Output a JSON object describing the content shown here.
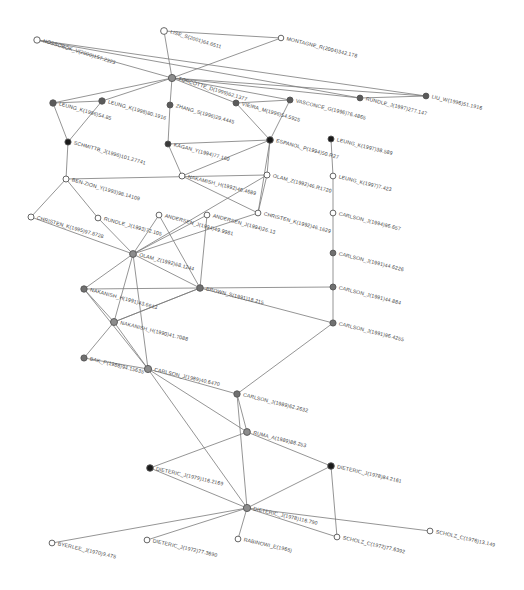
{
  "figure": {
    "type": "citation-network-graph",
    "width": 524,
    "height": 590,
    "background": "#ffffff",
    "edge_color": "#7a7a7a",
    "node_fill_dark": "#1a1a1a",
    "node_fill_mid": "#707070",
    "node_fill_light": "#ffffff",
    "node_stroke": "#555555",
    "label_color": "#4a4a4a"
  },
  "chart_data": {
    "type": "scatter",
    "title": "",
    "xlabel": "",
    "ylabel": "",
    "grid": false,
    "legend": "none",
    "nodes": [
      {
        "id": "n0",
        "label": "HOSSOBOK_V(2000)157.2323",
        "x": 37,
        "y": 40,
        "r": 3.2,
        "fill": "#ffffff",
        "angle": 17
      },
      {
        "id": "n1",
        "label": "LISE_S(2001)64.6511",
        "x": 164,
        "y": 31,
        "r": 3.4,
        "fill": "#ffffff",
        "angle": 17
      },
      {
        "id": "n2",
        "label": "MONTAGNE_R(2004)342.178",
        "x": 281,
        "y": 38,
        "r": 2.8,
        "fill": "#ffffff",
        "angle": 14
      },
      {
        "id": "n3",
        "label": "TORCOTTE_D(1999)62.1377",
        "x": 172,
        "y": 78,
        "r": 3.6,
        "fill": "#8c8c8c",
        "angle": 17
      },
      {
        "id": "n4",
        "label": "LEUNG_K(1996)54.85",
        "x": 53,
        "y": 103,
        "r": 3.2,
        "fill": "#5a5a5a",
        "angle": 16
      },
      {
        "id": "n5",
        "label": "LEUNG_K(1998)80.1916",
        "x": 102,
        "y": 101,
        "r": 3.2,
        "fill": "#5a5a5a",
        "angle": 16
      },
      {
        "id": "n6",
        "label": "ZHANG_S(1996)29.4445",
        "x": 170,
        "y": 105,
        "r": 3.0,
        "fill": "#5a5a5a",
        "angle": 16
      },
      {
        "id": "n7",
        "label": "VIEIRA_M(1996)54.5925",
        "x": 236,
        "y": 103,
        "r": 3.0,
        "fill": "#5a5a5a",
        "angle": 16
      },
      {
        "id": "n8",
        "label": "VASCONCE_G(1996)76.4865",
        "x": 290,
        "y": 100,
        "r": 3.0,
        "fill": "#5a5a5a",
        "angle": 14
      },
      {
        "id": "n9",
        "label": "RUNDLE_J(1997)277.147",
        "x": 360,
        "y": 98,
        "r": 2.9,
        "fill": "#5a5a5a",
        "angle": 14
      },
      {
        "id": "n10",
        "label": "LIU_W(1996)51.1916",
        "x": 426,
        "y": 96,
        "r": 2.9,
        "fill": "#5a5a5a",
        "angle": 13
      },
      {
        "id": "n11",
        "label": "SCHMITTB_J(1996)101.27741",
        "x": 68,
        "y": 142,
        "r": 3.1,
        "fill": "#1a1a1a",
        "angle": 16
      },
      {
        "id": "n12",
        "label": "KAGAN_Y(1994)77.160",
        "x": 168,
        "y": 144,
        "r": 3.0,
        "fill": "#3a3a3a",
        "angle": 15
      },
      {
        "id": "n13",
        "label": "ESPANOL_P(1994)50.R27",
        "x": 270,
        "y": 140,
        "r": 3.3,
        "fill": "#1a1a1a",
        "angle": 15
      },
      {
        "id": "n14",
        "label": "LEUNG_K(1997)38.589",
        "x": 331,
        "y": 139,
        "r": 3.0,
        "fill": "#1a1a1a",
        "angle": 14
      },
      {
        "id": "n15",
        "label": "BEN-ZION_Y(1993)98.14109",
        "x": 66,
        "y": 179,
        "r": 3.0,
        "fill": "#ffffff",
        "angle": 16
      },
      {
        "id": "n16",
        "label": "NAKAMISH_H(1992)46.4689",
        "x": 182,
        "y": 176,
        "r": 3.0,
        "fill": "#ffffff",
        "angle": 14
      },
      {
        "id": "n17",
        "label": "OLAM_Z(1992)46.R1720",
        "x": 267,
        "y": 175,
        "r": 3.0,
        "fill": "#ffffff",
        "angle": 15
      },
      {
        "id": "n18",
        "label": "LEUNG_K(1997)7.423",
        "x": 333,
        "y": 176,
        "r": 2.9,
        "fill": "#ffffff",
        "angle": 14
      },
      {
        "id": "n19",
        "label": "CHRISTEN_K(1995)97.8728",
        "x": 31,
        "y": 217,
        "r": 3.0,
        "fill": "#ffffff",
        "angle": 16
      },
      {
        "id": "n20",
        "label": "RUNDLE_J(1993)72.105",
        "x": 98,
        "y": 218,
        "r": 2.9,
        "fill": "#ffffff",
        "angle": 15
      },
      {
        "id": "n21",
        "label": "ANDERSEN_J(1994)49.9981",
        "x": 159,
        "y": 215,
        "r": 2.9,
        "fill": "#ffffff",
        "angle": 15
      },
      {
        "id": "n22",
        "label": "ANDERSEN_J(1994)26.13",
        "x": 207,
        "y": 215,
        "r": 2.9,
        "fill": "#ffffff",
        "angle": 15
      },
      {
        "id": "n23",
        "label": "CHRISTEN_K(1992)46.1629",
        "x": 258,
        "y": 213,
        "r": 2.9,
        "fill": "#ffffff",
        "angle": 15
      },
      {
        "id": "n24",
        "label": "CARLSON_J(1994)96.657",
        "x": 333,
        "y": 213,
        "r": 2.9,
        "fill": "#ffffff",
        "angle": 14
      },
      {
        "id": "n25",
        "label": "OLAM_Z(1992)68.1244",
        "x": 133,
        "y": 254,
        "r": 3.4,
        "fill": "#8c8c8c",
        "angle": 15
      },
      {
        "id": "n26",
        "label": "CARLSON_J(1991)44.6226",
        "x": 333,
        "y": 253,
        "r": 2.9,
        "fill": "#707070",
        "angle": 14
      },
      {
        "id": "n27",
        "label": "NAKANISH_H(1991)43.6613",
        "x": 84,
        "y": 289,
        "r": 3.2,
        "fill": "#707070",
        "angle": 15
      },
      {
        "id": "n28",
        "label": "BROWN_S(1991)18.215",
        "x": 200,
        "y": 288,
        "r": 3.3,
        "fill": "#707070",
        "angle": 14
      },
      {
        "id": "n29",
        "label": "CARLSON_J(1991)44.884",
        "x": 333,
        "y": 287,
        "r": 3.0,
        "fill": "#707070",
        "angle": 14
      },
      {
        "id": "n30",
        "label": "NAKANISH_H(1990)41.7088",
        "x": 114,
        "y": 322,
        "r": 3.5,
        "fill": "#8c8c8c",
        "angle": 14
      },
      {
        "id": "n31",
        "label": "CARLSON_J(1991)96.4255",
        "x": 333,
        "y": 323,
        "r": 3.1,
        "fill": "#707070",
        "angle": 14
      },
      {
        "id": "n32",
        "label": "BAK_P(1988)94.15635",
        "x": 84,
        "y": 358,
        "r": 3.1,
        "fill": "#707070",
        "angle": 14
      },
      {
        "id": "n33",
        "label": "CARLSON_J(1989)40.6470",
        "x": 148,
        "y": 369,
        "r": 3.6,
        "fill": "#8c8c8c",
        "angle": 13
      },
      {
        "id": "n34",
        "label": "CARLSON_J(1989)62.2632",
        "x": 237,
        "y": 394,
        "r": 3.2,
        "fill": "#707070",
        "angle": 14
      },
      {
        "id": "n35",
        "label": "RUMA_A(1989)88.253",
        "x": 247,
        "y": 432,
        "r": 3.4,
        "fill": "#8c8c8c",
        "angle": 14
      },
      {
        "id": "n36",
        "label": "DIETERIC_J(1978)84.2161",
        "x": 331,
        "y": 466,
        "r": 3.3,
        "fill": "#1a1a1a",
        "angle": 13
      },
      {
        "id": "n37",
        "label": "DIETERIC_J(1979)116.2169",
        "x": 150,
        "y": 468,
        "r": 3.3,
        "fill": "#1a1a1a",
        "angle": 13
      },
      {
        "id": "n38",
        "label": "DIETERIC_J(1978)116.790",
        "x": 247,
        "y": 508,
        "r": 3.6,
        "fill": "#8c8c8c",
        "angle": 13
      },
      {
        "id": "n39",
        "label": "BYERLEE_J(1970)9.475",
        "x": 52,
        "y": 543,
        "r": 2.9,
        "fill": "#ffffff",
        "angle": 13
      },
      {
        "id": "n40",
        "label": "DIETERIC_J(1972)77.3690",
        "x": 147,
        "y": 540,
        "r": 2.9,
        "fill": "#ffffff",
        "angle": 13
      },
      {
        "id": "n41",
        "label": "RABINOWI_E(1965)",
        "x": 238,
        "y": 539,
        "r": 2.9,
        "fill": "#ffffff",
        "angle": 13
      },
      {
        "id": "n42",
        "label": "SCHOLZ_C(1972)77.6392",
        "x": 337,
        "y": 537,
        "r": 2.9,
        "fill": "#ffffff",
        "angle": 13
      },
      {
        "id": "n43",
        "label": "SCHOLZ_C(1976)13.149",
        "x": 430,
        "y": 531,
        "r": 2.9,
        "fill": "#ffffff",
        "angle": 13
      }
    ],
    "edges": [
      [
        "n0",
        "n3"
      ],
      [
        "n1",
        "n3"
      ],
      [
        "n2",
        "n3"
      ],
      [
        "n3",
        "n4"
      ],
      [
        "n3",
        "n5"
      ],
      [
        "n3",
        "n6"
      ],
      [
        "n3",
        "n7"
      ],
      [
        "n3",
        "n8"
      ],
      [
        "n3",
        "n9"
      ],
      [
        "n3",
        "n10"
      ],
      [
        "n0",
        "n9"
      ],
      [
        "n0",
        "n10"
      ],
      [
        "n1",
        "n2"
      ],
      [
        "n4",
        "n5"
      ],
      [
        "n4",
        "n11"
      ],
      [
        "n5",
        "n11"
      ],
      [
        "n6",
        "n12"
      ],
      [
        "n7",
        "n13"
      ],
      [
        "n8",
        "n13"
      ],
      [
        "n9",
        "n10"
      ],
      [
        "n8",
        "n7"
      ],
      [
        "n11",
        "n15"
      ],
      [
        "n12",
        "n16"
      ],
      [
        "n13",
        "n17"
      ],
      [
        "n13",
        "n16"
      ],
      [
        "n14",
        "n18"
      ],
      [
        "n13",
        "n23"
      ],
      [
        "n12",
        "n13"
      ],
      [
        "n15",
        "n19"
      ],
      [
        "n15",
        "n20"
      ],
      [
        "n16",
        "n23"
      ],
      [
        "n17",
        "n23"
      ],
      [
        "n17",
        "n25"
      ],
      [
        "n18",
        "n24"
      ],
      [
        "n15",
        "n17"
      ],
      [
        "n19",
        "n25"
      ],
      [
        "n20",
        "n25"
      ],
      [
        "n21",
        "n25"
      ],
      [
        "n22",
        "n25"
      ],
      [
        "n23",
        "n25"
      ],
      [
        "n24",
        "n26"
      ],
      [
        "n21",
        "n28"
      ],
      [
        "n22",
        "n28"
      ],
      [
        "n25",
        "n27"
      ],
      [
        "n25",
        "n28"
      ],
      [
        "n25",
        "n30"
      ],
      [
        "n25",
        "n33"
      ],
      [
        "n26",
        "n29"
      ],
      [
        "n28",
        "n29"
      ],
      [
        "n28",
        "n30"
      ],
      [
        "n27",
        "n30"
      ],
      [
        "n27",
        "n33"
      ],
      [
        "n29",
        "n31"
      ],
      [
        "n28",
        "n31"
      ],
      [
        "n30",
        "n32"
      ],
      [
        "n30",
        "n33"
      ],
      [
        "n32",
        "n33"
      ],
      [
        "n33",
        "n34"
      ],
      [
        "n33",
        "n38"
      ],
      [
        "n31",
        "n34"
      ],
      [
        "n34",
        "n35"
      ],
      [
        "n33",
        "n35"
      ],
      [
        "n35",
        "n36"
      ],
      [
        "n35",
        "n37"
      ],
      [
        "n36",
        "n38"
      ],
      [
        "n37",
        "n38"
      ],
      [
        "n34",
        "n38"
      ],
      [
        "n38",
        "n39"
      ],
      [
        "n38",
        "n40"
      ],
      [
        "n38",
        "n41"
      ],
      [
        "n38",
        "n42"
      ],
      [
        "n38",
        "n43"
      ],
      [
        "n36",
        "n42"
      ],
      [
        "n30",
        "n28"
      ],
      [
        "n27",
        "n28"
      ]
    ]
  }
}
